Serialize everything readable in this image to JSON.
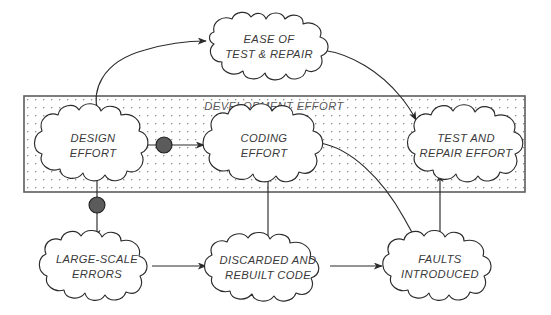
{
  "diagram": {
    "group": {
      "name": "development-effort-group",
      "label": "DEVELOPMENT EFFORT",
      "x": 24,
      "y": 96,
      "width": 501,
      "height": 96,
      "fill_pattern": "dotted",
      "dot_color": "#8d8d8d",
      "border_color": "#5d5d5d"
    },
    "nodes": [
      {
        "id": "ease-of-test-and-repair",
        "lines": [
          "EASE OF",
          "TEST & REPAIR"
        ],
        "cx": 269,
        "cy": 46,
        "rx": 57,
        "ry": 30,
        "inside_group": false
      },
      {
        "id": "design-effort",
        "lines": [
          "DESIGN",
          "EFFORT"
        ],
        "cx": 93,
        "cy": 145,
        "rx": 57,
        "ry": 36,
        "inside_group": true
      },
      {
        "id": "coding-effort",
        "lines": [
          "CODING",
          "EFFORT"
        ],
        "cx": 265,
        "cy": 145,
        "rx": 60,
        "ry": 36,
        "inside_group": true
      },
      {
        "id": "test-and-repair-effort",
        "lines": [
          "TEST AND",
          "REPAIR EFFORT"
        ],
        "cx": 466,
        "cy": 145,
        "rx": 58,
        "ry": 36,
        "inside_group": true
      },
      {
        "id": "large-scale-errors",
        "lines": [
          "LARGE-SCALE",
          "ERRORS"
        ],
        "cx": 97,
        "cy": 266,
        "rx": 59,
        "ry": 33,
        "inside_group": false
      },
      {
        "id": "discarded-and-rebuilt-code",
        "lines": [
          "DISCARDED AND",
          "REBUILT CODE"
        ],
        "cx": 268,
        "cy": 266,
        "rx": 64,
        "ry": 31,
        "inside_group": false
      },
      {
        "id": "faults-introduced",
        "lines": [
          "FAULTS",
          "INTRODUCED"
        ],
        "cx": 440,
        "cy": 266,
        "rx": 57,
        "ry": 33,
        "inside_group": false
      }
    ],
    "connectors": [
      {
        "id": "design-effort-to-ease-of-test-and-repair",
        "from": "design-effort",
        "to": "ease-of-test-and-repair",
        "style": "curved",
        "has_delay_marker": false
      },
      {
        "id": "ease-of-test-and-repair-to-test-and-repair-effort",
        "from": "ease-of-test-and-repair",
        "to": "test-and-repair-effort",
        "style": "curved",
        "has_delay_marker": false
      },
      {
        "id": "design-effort-to-coding-effort",
        "from": "design-effort",
        "to": "coding-effort",
        "style": "straight",
        "has_delay_marker": true
      },
      {
        "id": "design-effort-to-large-scale-errors",
        "from": "design-effort",
        "to": "large-scale-errors",
        "style": "straight",
        "has_delay_marker": true
      },
      {
        "id": "large-scale-errors-to-discarded-and-rebuilt-code",
        "from": "large-scale-errors",
        "to": "discarded-and-rebuilt-code",
        "style": "straight",
        "has_delay_marker": false
      },
      {
        "id": "discarded-and-rebuilt-code-to-coding-effort",
        "from": "discarded-and-rebuilt-code",
        "to": "coding-effort",
        "style": "straight",
        "has_delay_marker": false
      },
      {
        "id": "discarded-and-rebuilt-code-to-faults-introduced",
        "from": "discarded-and-rebuilt-code",
        "to": "faults-introduced",
        "style": "straight",
        "has_delay_marker": false
      },
      {
        "id": "coding-effort-to-faults-introduced",
        "from": "coding-effort",
        "to": "faults-introduced",
        "style": "curved",
        "has_delay_marker": false
      },
      {
        "id": "faults-introduced-to-test-and-repair-effort",
        "from": "faults-introduced",
        "to": "test-and-repair-effort",
        "style": "straight",
        "has_delay_marker": false
      }
    ],
    "delay_markers": [
      {
        "id": "delay-marker-design-to-coding",
        "cx": 164,
        "cy": 145,
        "r": 8
      },
      {
        "id": "delay-marker-design-to-errors",
        "cx": 97,
        "cy": 205,
        "r": 8
      }
    ],
    "colors": {
      "stroke": "#2b2b2b",
      "text": "#3a3a3a",
      "group_border": "#5d5d5d",
      "delay_fill": "#5b5b5b",
      "background": "#ffffff"
    }
  }
}
